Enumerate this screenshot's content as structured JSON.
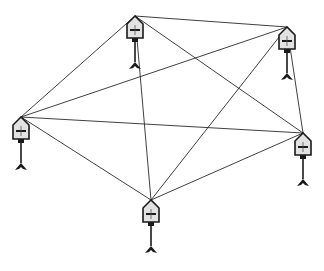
{
  "diagram": {
    "type": "fully-connected mesh network",
    "node_count": 5,
    "node_icon": "pole-mounted-sensor-icon",
    "colors": {
      "line": "#2a2a2a",
      "node_fill": "#d8d8d8",
      "node_stroke": "#1a1a1a",
      "background": "#ffffff"
    },
    "nodes": [
      {
        "id": "top",
        "x": 135,
        "y": 16
      },
      {
        "id": "top-right",
        "x": 287,
        "y": 27
      },
      {
        "id": "left",
        "x": 21,
        "y": 117
      },
      {
        "id": "right",
        "x": 303,
        "y": 133
      },
      {
        "id": "bottom",
        "x": 151,
        "y": 200
      }
    ]
  }
}
